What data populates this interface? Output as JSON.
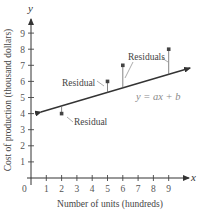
{
  "chart_data": {
    "type": "scatter",
    "title": "",
    "xlabel": "Number of units (hundreds)",
    "ylabel": "Cost of production (thousand dollars)",
    "x_axis_name": "x",
    "y_axis_name": "y",
    "origin_label": "0",
    "xlim": [
      0,
      10.5
    ],
    "ylim": [
      0,
      9.8
    ],
    "x_ticks": [
      1,
      2,
      3,
      4,
      5,
      6,
      7,
      8,
      9
    ],
    "y_ticks": [
      1,
      2,
      3,
      4,
      5,
      6,
      7,
      8,
      9
    ],
    "grid": false,
    "points": [
      {
        "x": 2,
        "y": 4
      },
      {
        "x": 5,
        "y": 6
      },
      {
        "x": 6,
        "y": 7
      },
      {
        "x": 9,
        "y": 8
      }
    ],
    "regression_line": {
      "equation_label": "y = ax + b",
      "slope": 0.28,
      "intercept": 3.92,
      "x_start": 0.65,
      "x_end": 10.4,
      "arrows_both_ends": true
    },
    "annotations": [
      {
        "text": "Residual",
        "target_points": [
          {
            "x": 2,
            "y": 4
          }
        ]
      },
      {
        "text": "Residual",
        "target_points": [
          {
            "x": 5,
            "y": 6
          }
        ]
      },
      {
        "text": "Residuals",
        "target_points": [
          {
            "x": 6,
            "y": 7
          },
          {
            "x": 9,
            "y": 8
          }
        ]
      }
    ]
  },
  "labels": {
    "residual_low": "Residual",
    "residual_mid": "Residual",
    "residuals": "Residuals",
    "equation": "y = ax + b",
    "x_axis_title": "Number of units (hundreds)",
    "y_axis_title": "Cost of production (thousand dollars)",
    "x_name": "x",
    "y_name": "y",
    "origin": "0",
    "ticks": [
      "1",
      "2",
      "3",
      "4",
      "5",
      "6",
      "7",
      "8",
      "9"
    ]
  }
}
